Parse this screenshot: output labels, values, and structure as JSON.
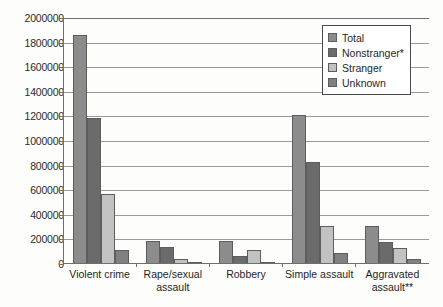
{
  "chart_data": {
    "type": "bar",
    "title": "",
    "xlabel": "",
    "ylabel": "",
    "ylim": [
      0,
      2000000
    ],
    "ytick_step": 200000,
    "grid": true,
    "legend_position": "upper-right-inside",
    "categories": [
      "Violent crime",
      "Rape/sexual\nassault",
      "Robbery",
      "Simple assault",
      "Aggravated\nassault**"
    ],
    "ytick_labels": [
      "2000000",
      "1800000",
      "1600000",
      "1400000",
      "1200000",
      "1000000",
      "800000",
      "600000",
      "400000",
      "200000",
      "0"
    ],
    "ytick_values": [
      2000000,
      1800000,
      1600000,
      1400000,
      1200000,
      1000000,
      800000,
      600000,
      400000,
      200000,
      0
    ],
    "series": [
      {
        "name": "Total",
        "color": "#8c8c8c",
        "values": [
          1855000,
          175000,
          175000,
          1200000,
          300000
        ]
      },
      {
        "name": "Nonstranger*",
        "color": "#6b6b6b",
        "values": [
          1180000,
          130000,
          60000,
          820000,
          170000
        ]
      },
      {
        "name": "Stranger",
        "color": "#c2c2c2",
        "values": [
          560000,
          35000,
          105000,
          300000,
          120000
        ]
      },
      {
        "name": "Unknown",
        "color": "#808080",
        "values": [
          105000,
          8000,
          6000,
          80000,
          30000
        ]
      }
    ]
  },
  "legend": {
    "items": [
      {
        "label": "Total"
      },
      {
        "label": "Nonstranger*"
      },
      {
        "label": "Stranger"
      },
      {
        "label": "Unknown"
      }
    ]
  }
}
